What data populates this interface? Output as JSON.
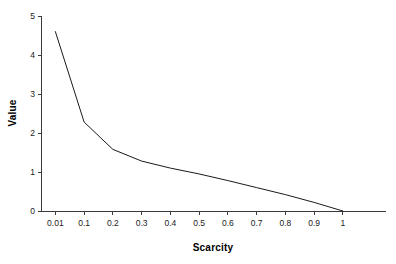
{
  "chart_data": {
    "type": "line",
    "title": "",
    "xlabel": "Scarcity",
    "ylabel": "Value",
    "grid": false,
    "legend": false,
    "legend_position": "none",
    "line_color": "#000000",
    "background_color": "#ffffff",
    "xscale": "categorical",
    "xlim": [
      0,
      11
    ],
    "ylim": [
      0,
      5
    ],
    "ytick_values": [
      0,
      1,
      2,
      3,
      4,
      5
    ],
    "ytick_labels": [
      "0",
      "1",
      "2",
      "3",
      "4",
      "5"
    ],
    "categories": [
      "0.01",
      "0.1",
      "0.2",
      "0.3",
      "0.4",
      "0.5",
      "0.6",
      "0.7",
      "0.8",
      "0.9",
      "1"
    ],
    "x": [
      0.01,
      0.1,
      0.2,
      0.3,
      0.4,
      0.5,
      0.6,
      0.7,
      0.8,
      0.9,
      1
    ],
    "values": [
      4.6,
      2.28,
      1.58,
      1.28,
      1.1,
      0.95,
      0.78,
      0.6,
      0.42,
      0.22,
      0
    ],
    "series": [
      {
        "name": "Value",
        "values": [
          4.6,
          2.28,
          1.58,
          1.28,
          1.1,
          0.95,
          0.78,
          0.6,
          0.42,
          0.22,
          0
        ]
      }
    ],
    "annotations": []
  },
  "axes": {
    "x_title": "Scarcity",
    "y_title": "Value"
  }
}
